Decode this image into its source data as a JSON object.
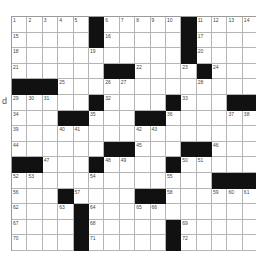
{
  "puzzle": {
    "rows": 15,
    "cols": 16,
    "colors": {
      "block": "#111111",
      "cell": "#ffffff",
      "gridline": "#b5b5b5",
      "number": "#444444"
    },
    "layout": [
      [
        "1",
        "2",
        "3",
        "4",
        "5",
        "#",
        "6",
        "7",
        "8",
        "9",
        "10",
        "#",
        "11",
        "12",
        "13",
        "14"
      ],
      [
        "15",
        "",
        "",
        "",
        "",
        "#",
        "16",
        "",
        "",
        "",
        "",
        "#",
        "17",
        "",
        "",
        ""
      ],
      [
        "18",
        "",
        "",
        "",
        "",
        "19",
        "",
        "",
        "",
        "",
        "",
        "#",
        "20",
        "",
        "",
        ""
      ],
      [
        "21",
        "",
        "",
        "",
        "",
        "",
        "#",
        "#",
        "22",
        "",
        "",
        "23",
        "#",
        "24",
        "",
        ""
      ],
      [
        "#",
        "#",
        "#",
        "25",
        "",
        "",
        "26",
        "27",
        "",
        "",
        "",
        "",
        "28",
        "",
        "",
        ""
      ],
      [
        "29",
        "30",
        "31",
        "",
        "",
        "#",
        "32",
        "",
        "",
        "",
        "#",
        "33",
        "",
        "",
        "#",
        "#"
      ],
      [
        "34",
        "",
        "",
        "#",
        "#",
        "35",
        "",
        "",
        "#",
        "#",
        "36",
        "",
        "",
        "",
        "37",
        "38"
      ],
      [
        "39",
        "",
        "",
        "40",
        "41",
        "",
        "",
        "",
        "42",
        "43",
        "",
        "",
        "",
        "",
        "",
        ""
      ],
      [
        "44",
        "",
        "",
        "",
        "",
        "",
        "#",
        "#",
        "45",
        "",
        "",
        "#",
        "#",
        "46",
        "",
        ""
      ],
      [
        "#",
        "#",
        "47",
        "",
        "",
        "#",
        "48",
        "49",
        "",
        "",
        "#",
        "50",
        "51",
        "",
        "",
        ""
      ],
      [
        "52",
        "53",
        "",
        "",
        "",
        "54",
        "",
        "",
        "",
        "",
        "55",
        "",
        "",
        "#",
        "#",
        "#"
      ],
      [
        "56",
        "",
        "",
        "#",
        "57",
        "",
        "",
        "",
        "#",
        "#",
        "58",
        "",
        "",
        "59",
        "60",
        "61"
      ],
      [
        "62",
        "",
        "",
        "63",
        "#",
        "64",
        "",
        "",
        "65",
        "66",
        "",
        "",
        "",
        "",
        "",
        ""
      ],
      [
        "67",
        "",
        "",
        "",
        "#",
        "68",
        "",
        "",
        "",
        "",
        "#",
        "69",
        "",
        "",
        "",
        ""
      ],
      [
        "70",
        "",
        "",
        "",
        "#",
        "71",
        "",
        "",
        "",
        "",
        "#",
        "72",
        "",
        "",
        "",
        ""
      ]
    ]
  },
  "margin_artifact": {
    "text": "d"
  }
}
